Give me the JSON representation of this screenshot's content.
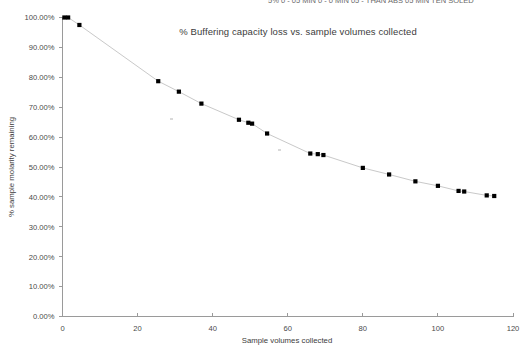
{
  "clipped_header": {
    "text": "5% 0  - 05 MIN 0 - 0 MIN 05 - THAN ABS  05 MIN TEN SOLED"
  },
  "axis": {
    "x_title": "Sample volumes collected",
    "y_title": "% sample molarity remaining",
    "x_ticks": [
      "0",
      "20",
      "40",
      "60",
      "80",
      "100",
      "120"
    ],
    "y_ticks": [
      "0.00%",
      "10.00%",
      "20.00%",
      "30.00%",
      "40.00%",
      "50.00%",
      "60.00%",
      "70.00%",
      "80.00%",
      "90.00%",
      "100.00%"
    ]
  },
  "chart_data": {
    "type": "scatter",
    "title": "% Buffering capacity loss vs. sample volumes collected",
    "xlabel": "Sample volumes collected",
    "ylabel": "% sample molarity remaining",
    "xlim": [
      0,
      120
    ],
    "ylim": [
      0,
      1
    ],
    "x_tick_values": [
      0,
      20,
      40,
      60,
      80,
      100,
      120
    ],
    "y_tick_values": [
      0,
      0.1,
      0.2,
      0.3,
      0.4,
      0.5,
      0.6,
      0.7,
      0.8,
      0.9,
      1.0
    ],
    "y_tick_format": "percent_2dp",
    "grid": false,
    "legend": "none",
    "marker": "square",
    "marker_color": "#000000",
    "line_color": "#c9c9c9",
    "series": [
      {
        "name": "% sample molarity remaining",
        "points": [
          {
            "x": 0.5,
            "y": 1.0
          },
          {
            "x": 1.5,
            "y": 1.0
          },
          {
            "x": 4.5,
            "y": 0.975
          },
          {
            "x": 25.5,
            "y": 0.787
          },
          {
            "x": 31.0,
            "y": 0.752
          },
          {
            "x": 37.0,
            "y": 0.712
          },
          {
            "x": 47.0,
            "y": 0.658
          },
          {
            "x": 49.5,
            "y": 0.648
          },
          {
            "x": 50.5,
            "y": 0.645
          },
          {
            "x": 54.5,
            "y": 0.612
          },
          {
            "x": 66.0,
            "y": 0.545
          },
          {
            "x": 68.0,
            "y": 0.543
          },
          {
            "x": 69.5,
            "y": 0.54
          },
          {
            "x": 80.0,
            "y": 0.497
          },
          {
            "x": 87.0,
            "y": 0.475
          },
          {
            "x": 94.0,
            "y": 0.452
          },
          {
            "x": 100.0,
            "y": 0.437
          },
          {
            "x": 105.5,
            "y": 0.42
          },
          {
            "x": 107.0,
            "y": 0.418
          },
          {
            "x": 113.0,
            "y": 0.405
          },
          {
            "x": 115.0,
            "y": 0.403
          }
        ]
      }
    ]
  }
}
